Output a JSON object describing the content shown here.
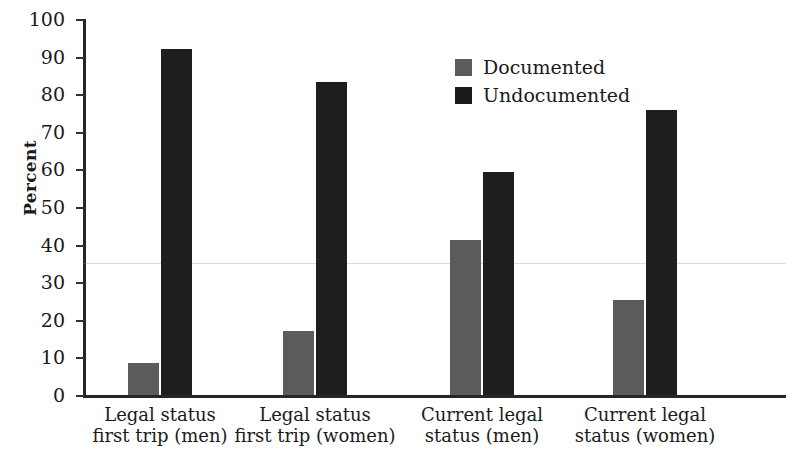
{
  "chart_data": {
    "type": "bar",
    "title": "",
    "xlabel": "",
    "ylabel": "Percent",
    "ylim": [
      0,
      100
    ],
    "ytick_step": 10,
    "yticks": [
      100,
      90,
      80,
      70,
      60,
      50,
      40,
      30,
      20,
      10,
      0
    ],
    "grid": false,
    "legend_position": "top-center-right",
    "categories": [
      "Legal status first trip (men)",
      "Legal status first trip (women)",
      "Current legal status (men)",
      "Current legal status (women)"
    ],
    "category_lines": [
      [
        "Legal status",
        "first trip (men)"
      ],
      [
        "Legal status",
        "first trip (women)"
      ],
      [
        "Current legal",
        "status (men)"
      ],
      [
        "Current legal",
        "status (women)"
      ]
    ],
    "series": [
      {
        "name": "Documented",
        "color": "#5b5b5b",
        "values": [
          8.5,
          17.0,
          41.3,
          25.2
        ]
      },
      {
        "name": "Undocumented",
        "color": "#1e1e1e",
        "values": [
          92.0,
          83.3,
          59.4,
          75.8
        ]
      }
    ]
  },
  "legend": {
    "items": [
      {
        "label": "Documented",
        "swatch": "documented-swatch"
      },
      {
        "label": "Undocumented",
        "swatch": "undocumented-swatch"
      }
    ]
  },
  "axis": {
    "y_title": "Percent"
  }
}
